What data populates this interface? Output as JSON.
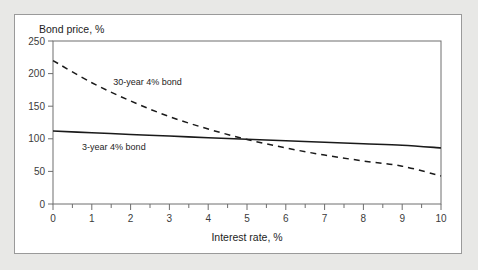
{
  "chart_data": {
    "type": "line",
    "title": "",
    "xlabel": "Interest rate, %",
    "ylabel": "Bond price, %",
    "xlim": [
      0,
      10
    ],
    "ylim": [
      0,
      250
    ],
    "xticks": [
      "0",
      "1",
      "2",
      "3",
      "4",
      "5",
      "6",
      "7",
      "8",
      "9",
      "10"
    ],
    "yticks": [
      "0",
      "50",
      "100",
      "150",
      "200",
      "250"
    ],
    "x_minor_tick_step": 0.5,
    "grid": false,
    "legend_position": "inline-annotations",
    "series": [
      {
        "name": "30-year 4% bond",
        "style": "dashed",
        "color": "#1a1a1a",
        "label_x": 1.55,
        "label_y": 182,
        "x": [
          0,
          1,
          2,
          3,
          4,
          5,
          6,
          7,
          8,
          9,
          10
        ],
        "values": [
          220,
          186,
          158,
          134,
          115,
          99,
          86,
          75,
          66,
          58,
          43
        ]
      },
      {
        "name": "3-year 4% bond",
        "style": "solid",
        "color": "#1a1a1a",
        "label_x": 0.75,
        "label_y": 83,
        "x": [
          0,
          1,
          2,
          3,
          4,
          5,
          6,
          7,
          8,
          9,
          10
        ],
        "values": [
          112,
          109.3,
          106.7,
          104.2,
          101.7,
          99.3,
          96.9,
          94.6,
          92.3,
          90.1,
          86
        ]
      }
    ]
  }
}
